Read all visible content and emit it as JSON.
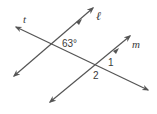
{
  "diagram": {
    "type": "parallel-lines-cut-by-transversal",
    "lines": [
      {
        "id": "t",
        "label": "t",
        "role": "transversal"
      },
      {
        "id": "l",
        "label": "ℓ",
        "role": "parallel"
      },
      {
        "id": "m",
        "label": "m",
        "role": "parallel"
      }
    ],
    "angles": [
      {
        "label": "63°",
        "at": "intersection t-ℓ"
      },
      {
        "label": "1",
        "at": "intersection t-m"
      },
      {
        "label": "2",
        "at": "intersection t-m"
      }
    ],
    "colors": {
      "line": "#555555",
      "text": "#3a3a3a"
    }
  }
}
